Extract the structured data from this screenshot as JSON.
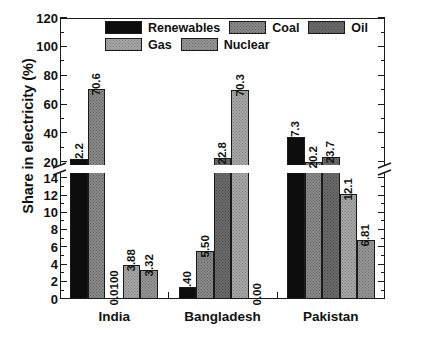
{
  "chart_data": {
    "type": "bar",
    "title": "",
    "subtitle": "",
    "xlabel": "",
    "ylabel": "Share in electricity (%)",
    "categories": [
      "India",
      "Bangladesh",
      "Pakistan"
    ],
    "series": [
      {
        "name": "Renewables",
        "color": "#0d0d0d",
        "values": [
          22.2,
          1.4,
          37.3
        ],
        "labels": [
          "22.2",
          "1.40",
          "37.3"
        ]
      },
      {
        "name": "Coal",
        "color": "#8a8a8a",
        "values": [
          70.6,
          5.5,
          20.2
        ],
        "labels": [
          "70.6",
          "5.50",
          "20.2"
        ]
      },
      {
        "name": "Oil",
        "color": "#6b6b6b",
        "values": [
          0.01,
          22.8,
          23.7
        ],
        "labels": [
          "0.0100",
          "22.8",
          "23.7"
        ]
      },
      {
        "name": "Gas",
        "color": "#a6a6a6",
        "values": [
          3.88,
          70.3,
          12.1
        ],
        "labels": [
          "3.88",
          "70.3",
          "12.1"
        ]
      },
      {
        "name": "Nuclear",
        "color": "#949494",
        "values": [
          3.32,
          0.0,
          6.81
        ],
        "labels": [
          "3.32",
          "0.00",
          "6.81"
        ]
      }
    ],
    "axis_break": {
      "lower_max": 14,
      "upper_min": 20
    },
    "ylim_lower": [
      0,
      14
    ],
    "ylim_upper": [
      20,
      120
    ],
    "yticks_lower": [
      "0",
      "2",
      "4",
      "6",
      "8",
      "10",
      "12",
      "14"
    ],
    "yticks_upper": [
      "20",
      "40",
      "60",
      "80",
      "100",
      "120"
    ],
    "grid": false,
    "legend_position": "top-center"
  },
  "legend": {
    "items": [
      {
        "label": "Renewables",
        "swatch": "renewables"
      },
      {
        "label": "Coal",
        "swatch": "coal"
      },
      {
        "label": "Oil",
        "swatch": "oil"
      },
      {
        "label": "Gas",
        "swatch": "gas"
      },
      {
        "label": "Nuclear",
        "swatch": "nuclear"
      }
    ]
  },
  "axis": {
    "y_title": "Share in electricity (%)",
    "y_ticks": [
      "120",
      "100",
      "80",
      "60",
      "40",
      "20",
      "14",
      "12",
      "10",
      "8",
      "6",
      "4",
      "2",
      "0"
    ],
    "x_ticks": [
      "India",
      "Bangladesh",
      "Pakistan"
    ]
  }
}
